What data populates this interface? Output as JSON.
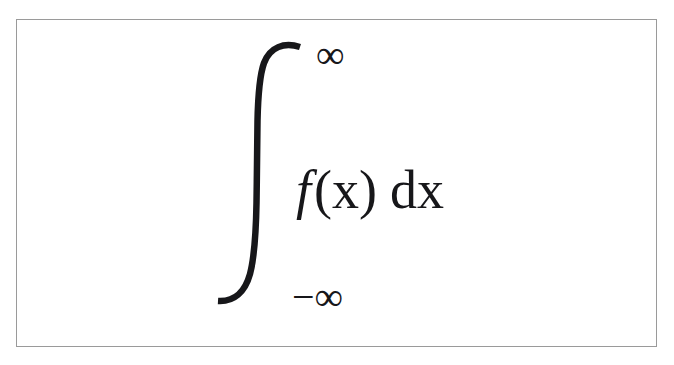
{
  "figure": {
    "kind": "mathematical-expression",
    "latex": "\\int_{-\\infty}^{\\infty} f(x)\\,dx",
    "plain_text": "integral from -infinity to infinity of f(x) dx",
    "border_color": "#9a9a9a",
    "ink_color": "#17171a",
    "background_color": "#ffffff"
  },
  "expression": {
    "integral_symbol": "∫",
    "upper_limit": "∞",
    "lower_limit": "−∞",
    "integrand": {
      "function_name": "f",
      "open_paren": "(",
      "variable": "x",
      "close_paren": ")",
      "differential": "dx"
    }
  }
}
